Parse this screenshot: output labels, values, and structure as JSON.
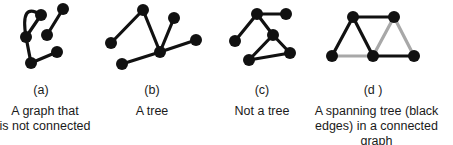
{
  "figure": {
    "panels": [
      {
        "id": "a",
        "label": "(a)",
        "caption_line1": "A graph that",
        "caption_line2": "is not connected",
        "nodes": [
          {
            "id": "a1",
            "x": 41,
            "y": 15
          },
          {
            "id": "a2",
            "x": 63,
            "y": 9
          },
          {
            "id": "a3",
            "x": 26,
            "y": 37
          },
          {
            "id": "a4",
            "x": 47,
            "y": 35
          },
          {
            "id": "a5",
            "x": 57,
            "y": 52
          },
          {
            "id": "a6",
            "x": 31,
            "y": 63
          }
        ],
        "edges": [
          {
            "from": "a3",
            "to": "a1",
            "color": "#111111",
            "curved": true
          },
          {
            "from": "a3",
            "to": "a1",
            "color": "#111111"
          },
          {
            "from": "a2",
            "to": "a4",
            "color": "#111111"
          },
          {
            "from": "a3",
            "to": "a6",
            "color": "#111111"
          },
          {
            "from": "a6",
            "to": "a5",
            "color": "#111111"
          }
        ]
      },
      {
        "id": "b",
        "label": "(b)",
        "caption_line1": "A tree",
        "caption_line2": "",
        "nodes": [
          {
            "id": "b1",
            "x": 143,
            "y": 10
          },
          {
            "id": "b2",
            "x": 174,
            "y": 18
          },
          {
            "id": "b3",
            "x": 111,
            "y": 43
          },
          {
            "id": "b4",
            "x": 196,
            "y": 40
          },
          {
            "id": "b5",
            "x": 160,
            "y": 52
          },
          {
            "id": "b6",
            "x": 122,
            "y": 64
          }
        ],
        "edges": [
          {
            "from": "b3",
            "to": "b1",
            "color": "#111111"
          },
          {
            "from": "b1",
            "to": "b5",
            "color": "#111111"
          },
          {
            "from": "b2",
            "to": "b5",
            "color": "#111111"
          },
          {
            "from": "b5",
            "to": "b4",
            "color": "#111111"
          },
          {
            "from": "b5",
            "to": "b6",
            "color": "#111111"
          }
        ]
      },
      {
        "id": "c",
        "label": "(c)",
        "caption_line1": "Not a tree",
        "caption_line2": "",
        "nodes": [
          {
            "id": "c1",
            "x": 257,
            "y": 14
          },
          {
            "id": "c2",
            "x": 286,
            "y": 14
          },
          {
            "id": "c3",
            "x": 235,
            "y": 41
          },
          {
            "id": "c4",
            "x": 273,
            "y": 35
          },
          {
            "id": "c5",
            "x": 290,
            "y": 53
          },
          {
            "id": "c6",
            "x": 249,
            "y": 60
          }
        ],
        "edges": [
          {
            "from": "c1",
            "to": "c2",
            "color": "#111111"
          },
          {
            "from": "c1",
            "to": "c3",
            "color": "#111111"
          },
          {
            "from": "c1",
            "to": "c4",
            "color": "#111111"
          },
          {
            "from": "c4",
            "to": "c5",
            "color": "#111111"
          },
          {
            "from": "c4",
            "to": "c6",
            "color": "#111111"
          },
          {
            "from": "c6",
            "to": "c5",
            "color": "#111111"
          }
        ]
      },
      {
        "id": "d",
        "label": "(d )",
        "caption_line1": "A spanning tree (black",
        "caption_line2": "edges) in a connected graph",
        "nodes": [
          {
            "id": "d1",
            "x": 353,
            "y": 17
          },
          {
            "id": "d2",
            "x": 394,
            "y": 17
          },
          {
            "id": "d3",
            "x": 332,
            "y": 56
          },
          {
            "id": "d4",
            "x": 373,
            "y": 56
          },
          {
            "id": "d5",
            "x": 414,
            "y": 56
          }
        ],
        "edges": [
          {
            "from": "d3",
            "to": "d4",
            "color": "#a8a8a8"
          },
          {
            "from": "d2",
            "to": "d4",
            "color": "#a8a8a8"
          },
          {
            "from": "d2",
            "to": "d5",
            "color": "#a8a8a8"
          },
          {
            "from": "d3",
            "to": "d1",
            "color": "#111111"
          },
          {
            "from": "d1",
            "to": "d2",
            "color": "#111111"
          },
          {
            "from": "d1",
            "to": "d4",
            "color": "#111111"
          },
          {
            "from": "d4",
            "to": "d5",
            "color": "#111111"
          }
        ]
      }
    ],
    "style": {
      "node_radius": 6,
      "node_color": "#111111",
      "edge_width": 3.2,
      "tree_edge_color": "#111111",
      "non_tree_edge_color": "#a8a8a8"
    }
  }
}
